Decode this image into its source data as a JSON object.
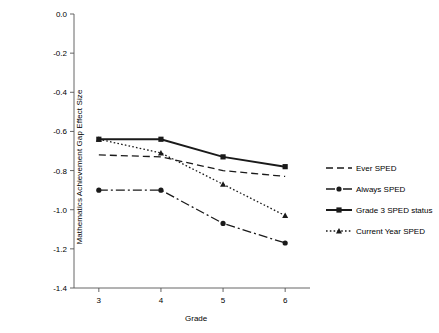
{
  "chart_data": {
    "type": "line",
    "title": "",
    "xlabel": "Grade",
    "ylabel": "Mathematics Achievement Gap Effect Size",
    "categories": [
      "3",
      "4",
      "5",
      "6"
    ],
    "x": [
      3,
      4,
      5,
      6
    ],
    "xlim": [
      2.6,
      6.4
    ],
    "ylim": [
      -1.4,
      0.0
    ],
    "yticks": [
      "0.0",
      "-0.2",
      "-0.4",
      "-0.6",
      "-0.8",
      "-1.0",
      "-1.2",
      "-1.4"
    ],
    "ytick_values": [
      0.0,
      -0.2,
      -0.4,
      -0.6,
      -0.8,
      -1.0,
      -1.2,
      -1.4
    ],
    "xticks": [
      "3",
      "4",
      "5",
      "6"
    ],
    "grid": false,
    "legend_position": "right",
    "series": [
      {
        "name": "Ever SPED",
        "style": "dashed",
        "marker": "none",
        "values": [
          -0.72,
          -0.73,
          -0.8,
          -0.83
        ]
      },
      {
        "name": "Always SPED",
        "style": "dash-dot",
        "marker": "circle",
        "values": [
          -0.9,
          -0.9,
          -1.07,
          -1.17
        ]
      },
      {
        "name": "Grade 3 SPED status",
        "style": "solid",
        "marker": "square",
        "values": [
          -0.64,
          -0.64,
          -0.73,
          -0.78
        ]
      },
      {
        "name": "Current Year SPED",
        "style": "dotted",
        "marker": "triangle",
        "values": [
          -0.64,
          -0.71,
          -0.87,
          -1.03
        ]
      }
    ]
  },
  "legend": {
    "items": [
      {
        "label": "Ever SPED"
      },
      {
        "label": "Always SPED"
      },
      {
        "label": "Grade 3 SPED status"
      },
      {
        "label": "Current Year SPED"
      }
    ]
  },
  "axes": {
    "y_title": "Mathematics Achievement Gap Effect Size",
    "x_title": "Grade"
  },
  "colors": {
    "line": "#1a1a1a",
    "axis": "#555555",
    "background": "#ffffff"
  }
}
